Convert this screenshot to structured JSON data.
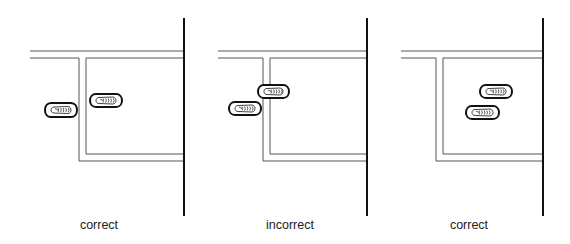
{
  "panels": [
    {
      "label": "correct",
      "label_center_x": 99,
      "corridor": {
        "x_start": 30,
        "wall_x": 184,
        "outer_top_y": 51,
        "inner_top_y": 58,
        "outer_left_x": 79,
        "inner_left_x": 86,
        "outer_bottom_y": 161,
        "inner_bottom_y": 154
      },
      "wall": {
        "top": 18,
        "bottom": 216
      },
      "shoes": [
        {
          "x": 45,
          "y": 103,
          "w": 33,
          "h": 14
        },
        {
          "x": 90,
          "y": 94,
          "w": 33,
          "h": 13
        }
      ]
    },
    {
      "label": "incorrect",
      "label_center_x": 290,
      "corridor": {
        "x_start": 218,
        "wall_x": 367,
        "outer_top_y": 51,
        "inner_top_y": 58,
        "outer_left_x": 263,
        "inner_left_x": 270,
        "outer_bottom_y": 161,
        "inner_bottom_y": 154
      },
      "wall": {
        "top": 18,
        "bottom": 216
      },
      "shoes": [
        {
          "x": 258,
          "y": 85,
          "w": 32,
          "h": 13
        },
        {
          "x": 229,
          "y": 102,
          "w": 33,
          "h": 13
        }
      ]
    },
    {
      "label": "correct",
      "label_center_x": 469,
      "corridor": {
        "x_start": 401,
        "wall_x": 543,
        "outer_top_y": 51,
        "inner_top_y": 58,
        "outer_left_x": 436,
        "inner_left_x": 443,
        "outer_bottom_y": 161,
        "inner_bottom_y": 154
      },
      "wall": {
        "top": 18,
        "bottom": 216
      },
      "shoes": [
        {
          "x": 480,
          "y": 85,
          "w": 33,
          "h": 13
        },
        {
          "x": 466,
          "y": 106,
          "w": 34,
          "h": 13
        }
      ]
    }
  ],
  "colors": {
    "line": "#555555",
    "wall": "#111111",
    "shoe": "#111111"
  }
}
